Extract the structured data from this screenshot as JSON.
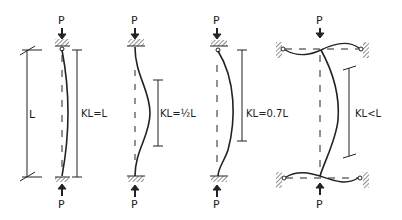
{
  "diagram": {
    "load_label": "P",
    "columns": [
      {
        "id": "pinned-pinned",
        "length_label": "L",
        "kl_label": "KL=L"
      },
      {
        "id": "fixed-fixed",
        "kl_label": "KL=½L"
      },
      {
        "id": "fixed-pinned",
        "kl_label": "KL=0.7L"
      },
      {
        "id": "frame-restrained",
        "kl_label": "KL<L"
      }
    ],
    "colors": {
      "ink": "#222222",
      "hatch": "#555555"
    }
  }
}
